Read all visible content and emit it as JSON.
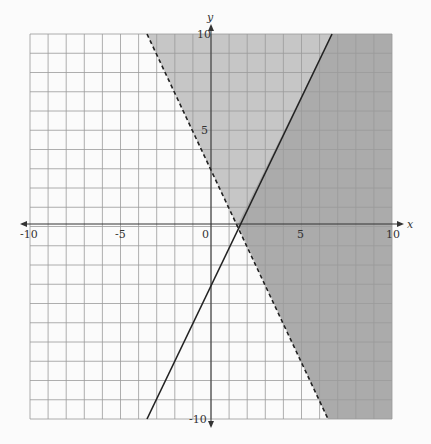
{
  "chart_data": {
    "type": "inequality-graph",
    "title": "",
    "xlabel": "x",
    "ylabel": "y",
    "xlim": [
      -10,
      10
    ],
    "ylim": [
      -10,
      10
    ],
    "grid": true,
    "x_ticks_labeled": [
      "-10",
      "-5",
      "0",
      "5",
      "10"
    ],
    "y_ticks_labeled": [
      "10",
      "5",
      "-10"
    ],
    "lines": [
      {
        "name": "boundary-solid",
        "equation": "y = 2x - 3",
        "style": "solid",
        "points": [
          [
            -3.5,
            -10
          ],
          [
            6.5,
            10
          ]
        ]
      },
      {
        "name": "boundary-dashed",
        "equation": "y = -2x + 3",
        "style": "dashed",
        "points": [
          [
            -3.5,
            10
          ],
          [
            6.5,
            -10
          ]
        ]
      }
    ],
    "shaded_regions": [
      {
        "inequality": "y > -2x + 3",
        "shade": "light"
      },
      {
        "inequality": "y <= 2x - 3",
        "shade": "dark (overlap)"
      }
    ],
    "intersection": [
      1.5,
      0
    ]
  },
  "labels": {
    "x_axis": "x",
    "y_axis": "y",
    "x_neg10": "-10",
    "x_neg5": "-5",
    "origin": "0",
    "x_5": "5",
    "x_10": "10",
    "y_10": "10",
    "y_5": "5",
    "y_neg10": "-10"
  },
  "colors": {
    "light_shade": "#c4c4c4",
    "dark_shade": "#a9a9a9",
    "grid": "#9a9a9a",
    "line": "#222222"
  }
}
